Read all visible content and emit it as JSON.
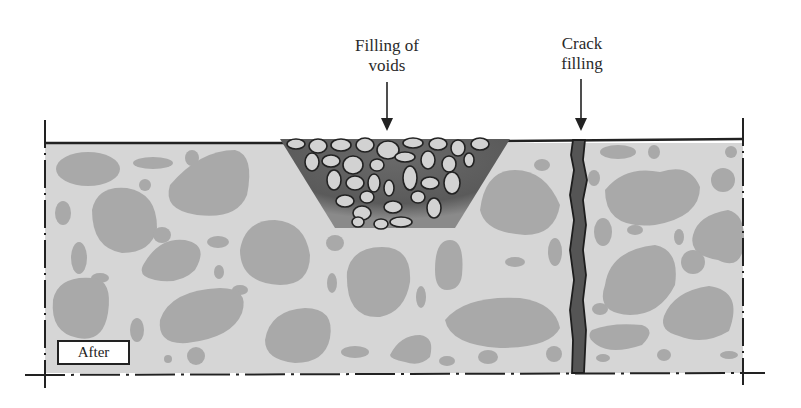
{
  "diagram": {
    "labels": {
      "voids": "Filling of voids",
      "voids_line1": "Filling of",
      "voids_line2": "voids",
      "crack": "Crack filling",
      "crack_line1": "Crack",
      "crack_line2": "filling",
      "state": "After"
    },
    "colors": {
      "concrete": "#d6d6d6",
      "aggregate": "#a9a9a9",
      "void_fill_matrix": "#5a5a5a",
      "void_stone": "#d2d2d2",
      "crack_fill": "#555555",
      "outline": "#222222"
    }
  }
}
